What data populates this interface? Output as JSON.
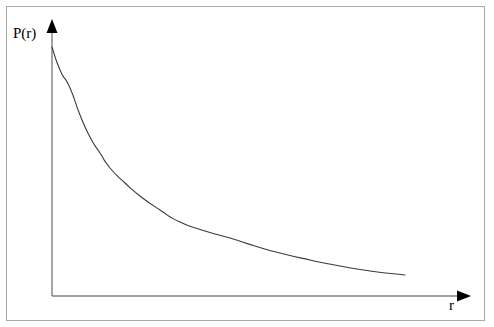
{
  "figure": {
    "name": "probability-decay-plot",
    "background_color": "#ffffff",
    "border_color": "#a9a9a9",
    "axis_color": "#7f7f7f",
    "curve_color": "#3a3a3a"
  },
  "axes": {
    "y_axis_label": "P(r)",
    "x_axis_label": "r",
    "y_axis_arrow": "up-arrow-icon",
    "x_axis_arrow": "right-arrow-icon",
    "origin": {
      "x": 52,
      "y": 296
    },
    "y_axis_top": {
      "x": 52,
      "y": 20
    },
    "x_axis_right": {
      "x": 470,
      "y": 296
    }
  },
  "chart_data": {
    "type": "line",
    "title": "",
    "xlabel": "r",
    "ylabel": "P(r)",
    "grid": false,
    "legend": false,
    "axis_ticks": false,
    "x": [
      52,
      60,
      70,
      80,
      90,
      100,
      110,
      125,
      140,
      160,
      180,
      205,
      230,
      255,
      280,
      310,
      340,
      370,
      405
    ],
    "y": [
      47,
      70,
      88,
      115,
      137,
      153,
      168,
      183,
      196,
      210,
      222,
      231,
      238,
      246,
      253,
      260,
      266,
      271,
      275
    ],
    "series": [
      {
        "name": "P(r)",
        "points": [
          [
            52,
            47
          ],
          [
            60,
            70
          ],
          [
            70,
            88
          ],
          [
            80,
            115
          ],
          [
            90,
            137
          ],
          [
            100,
            153
          ],
          [
            110,
            168
          ],
          [
            125,
            183
          ],
          [
            140,
            196
          ],
          [
            160,
            210
          ],
          [
            180,
            222
          ],
          [
            205,
            231
          ],
          [
            230,
            238
          ],
          [
            255,
            246
          ],
          [
            280,
            253
          ],
          [
            310,
            260
          ],
          [
            340,
            266
          ],
          [
            370,
            271
          ],
          [
            405,
            275
          ]
        ]
      }
    ],
    "xlim": [
      52,
      470
    ],
    "ylim": [
      296,
      20
    ]
  }
}
